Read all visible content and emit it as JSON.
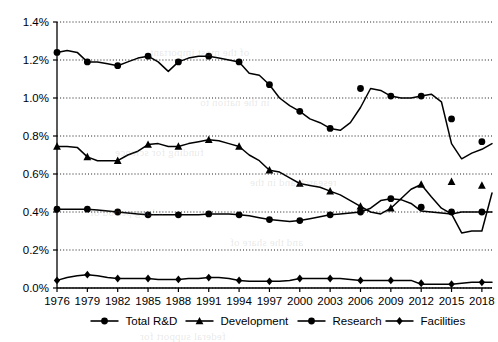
{
  "chart_data": {
    "type": "line",
    "title": "",
    "subtitle": "",
    "xlabel": "",
    "ylabel": "",
    "xlim": [
      1976,
      2019
    ],
    "ylim": [
      0.0,
      1.4
    ],
    "y_tick_labels": [
      "0.0%",
      "0.2%",
      "0.4%",
      "0.6%",
      "0.8%",
      "1.0%",
      "1.2%",
      "1.4%"
    ],
    "y_tick_values": [
      0.0,
      0.2,
      0.4,
      0.6,
      0.8,
      1.0,
      1.2,
      1.4
    ],
    "x_tick_labels": [
      "1976",
      "1979",
      "1982",
      "1985",
      "1988",
      "1991",
      "1994",
      "1997",
      "2000",
      "2003",
      "2006",
      "2009",
      "2012",
      "2015",
      "2018"
    ],
    "x_tick_values": [
      1976,
      1979,
      1982,
      1985,
      1988,
      1991,
      1994,
      1997,
      2000,
      2003,
      2006,
      2009,
      2012,
      2015,
      2018
    ],
    "grid": true,
    "grid_style": "dotted-horizontal",
    "legend_position": "bottom",
    "x": [
      1976,
      1977,
      1978,
      1979,
      1980,
      1981,
      1982,
      1983,
      1984,
      1985,
      1986,
      1987,
      1988,
      1989,
      1990,
      1991,
      1992,
      1993,
      1994,
      1995,
      1996,
      1997,
      1998,
      1999,
      2000,
      2001,
      2002,
      2003,
      2004,
      2005,
      2006,
      2007,
      2008,
      2009,
      2010,
      2011,
      2012,
      2013,
      2014,
      2015,
      2016,
      2017,
      2018,
      2019
    ],
    "series": [
      {
        "name": "Total R&D",
        "marker": "circle",
        "values": [
          1.24,
          1.25,
          1.24,
          1.19,
          1.19,
          1.18,
          1.17,
          1.19,
          1.21,
          1.22,
          1.19,
          1.14,
          1.19,
          1.21,
          1.22,
          1.22,
          1.21,
          1.2,
          1.19,
          1.13,
          1.12,
          1.07,
          1.0,
          0.96,
          0.93,
          0.89,
          0.87,
          0.84,
          0.83,
          0.87,
          0.95,
          1.05,
          1.04,
          1.01,
          1.0,
          1.0,
          1.01,
          1.02,
          0.98,
          0.89,
          0.8,
          0.78,
          0.77,
          0.76
        ]
      },
      {
        "name": "Development",
        "marker": "triangle",
        "values": [
          0.745,
          0.745,
          0.74,
          0.69,
          0.67,
          0.67,
          0.67,
          0.7,
          0.72,
          0.755,
          0.76,
          0.745,
          0.745,
          0.76,
          0.77,
          0.78,
          0.775,
          0.76,
          0.745,
          0.7,
          0.67,
          0.62,
          0.61,
          0.58,
          0.55,
          0.54,
          0.53,
          0.51,
          0.49,
          0.46,
          0.43,
          0.4,
          0.39,
          0.42,
          0.47,
          0.52,
          0.545,
          0.54,
          0.55,
          0.56,
          0.57,
          0.565,
          0.54,
          0.5
        ]
      },
      {
        "name": "Research",
        "marker": "circle",
        "values": [
          0.415,
          0.415,
          0.415,
          0.415,
          0.41,
          0.405,
          0.4,
          0.395,
          0.39,
          0.385,
          0.385,
          0.385,
          0.385,
          0.385,
          0.385,
          0.39,
          0.39,
          0.39,
          0.385,
          0.38,
          0.37,
          0.36,
          0.355,
          0.35,
          0.355,
          0.365,
          0.375,
          0.385,
          0.39,
          0.395,
          0.4,
          0.42,
          0.46,
          0.47,
          0.465,
          0.445,
          0.425,
          0.41,
          0.405,
          0.4,
          0.4,
          0.405,
          0.4,
          0.4
        ]
      },
      {
        "name": "Facilities",
        "marker": "diamond",
        "values": [
          0.04,
          0.055,
          0.065,
          0.07,
          0.065,
          0.055,
          0.05,
          0.05,
          0.05,
          0.05,
          0.045,
          0.045,
          0.045,
          0.05,
          0.05,
          0.055,
          0.055,
          0.05,
          0.04,
          0.035,
          0.035,
          0.035,
          0.035,
          0.04,
          0.05,
          0.05,
          0.05,
          0.05,
          0.05,
          0.045,
          0.04,
          0.04,
          0.04,
          0.04,
          0.04,
          0.04,
          0.025,
          0.02,
          0.02,
          0.02,
          0.02,
          0.025,
          0.03,
          0.03
        ]
      }
    ],
    "note_2012_2019_detail": {
      "Total R&D": {
        "2012": 1.01,
        "2013": 1.02,
        "2014": 0.98,
        "2015": 0.76,
        "2016": 0.68,
        "2017": 0.71,
        "2018": 0.73
      },
      "Development": {
        "2012": 0.545,
        "2013": 0.48,
        "2014": 0.42,
        "2015": 0.39,
        "2016": 0.29,
        "2017": 0.3,
        "2018": 0.3
      },
      "Research": {
        "2012": 0.405,
        "2013": 0.4,
        "2014": 0.395,
        "2015": 0.39,
        "2016": 0.4,
        "2017": 0.4,
        "2018": 0.4
      },
      "Facilities": {
        "2012": 0.02,
        "2013": 0.02,
        "2014": 0.02,
        "2015": 0.02,
        "2016": 0.025,
        "2017": 0.03,
        "2018": 0.03
      }
    },
    "marked_points": {
      "Total R&D": [
        [
          1976,
          1.24
        ],
        [
          1979,
          1.19
        ],
        [
          1982,
          1.17
        ],
        [
          1985,
          1.22
        ],
        [
          1988,
          1.19
        ],
        [
          1991,
          1.22
        ],
        [
          1994,
          1.19
        ],
        [
          1997,
          1.07
        ],
        [
          2000,
          0.93
        ],
        [
          2003,
          0.84
        ],
        [
          2006,
          1.05
        ],
        [
          2009,
          1.01
        ],
        [
          2012,
          1.01
        ],
        [
          2015,
          0.89
        ],
        [
          2018,
          0.77
        ]
      ],
      "Development": [
        [
          1976,
          0.745
        ],
        [
          1979,
          0.69
        ],
        [
          1982,
          0.67
        ],
        [
          1985,
          0.755
        ],
        [
          1988,
          0.745
        ],
        [
          1991,
          0.78
        ],
        [
          1994,
          0.745
        ],
        [
          1997,
          0.62
        ],
        [
          2000,
          0.55
        ],
        [
          2003,
          0.51
        ],
        [
          2006,
          0.43
        ],
        [
          2009,
          0.42
        ],
        [
          2012,
          0.545
        ],
        [
          2015,
          0.56
        ],
        [
          2018,
          0.54
        ]
      ],
      "Research": [
        [
          1976,
          0.415
        ],
        [
          1979,
          0.415
        ],
        [
          1982,
          0.4
        ],
        [
          1985,
          0.385
        ],
        [
          1988,
          0.385
        ],
        [
          1991,
          0.39
        ],
        [
          1994,
          0.385
        ],
        [
          1997,
          0.36
        ],
        [
          2000,
          0.355
        ],
        [
          2003,
          0.385
        ],
        [
          2006,
          0.4
        ],
        [
          2009,
          0.47
        ],
        [
          2012,
          0.425
        ],
        [
          2015,
          0.4
        ],
        [
          2018,
          0.4
        ]
      ],
      "Facilities": [
        [
          1976,
          0.04
        ],
        [
          1979,
          0.07
        ],
        [
          1982,
          0.05
        ],
        [
          1985,
          0.05
        ],
        [
          1988,
          0.045
        ],
        [
          1991,
          0.055
        ],
        [
          1994,
          0.04
        ],
        [
          1997,
          0.035
        ],
        [
          2000,
          0.05
        ],
        [
          2003,
          0.05
        ],
        [
          2006,
          0.04
        ],
        [
          2009,
          0.04
        ],
        [
          2012,
          0.025
        ],
        [
          2015,
          0.02
        ],
        [
          2018,
          0.03
        ]
      ]
    }
  },
  "legend": {
    "items": [
      {
        "label": "Total R&D",
        "marker": "circle"
      },
      {
        "label": "Development",
        "marker": "triangle"
      },
      {
        "label": "Research",
        "marker": "circle"
      },
      {
        "label": "Facilities",
        "marker": "diamond"
      }
    ]
  },
  "background_bleed": {
    "visible": true,
    "lines": [
      "of the most important",
      "in the nation to",
      "funding for science",
      "research and in the",
      "a long period of",
      "and the share of",
      "federal support for"
    ]
  }
}
